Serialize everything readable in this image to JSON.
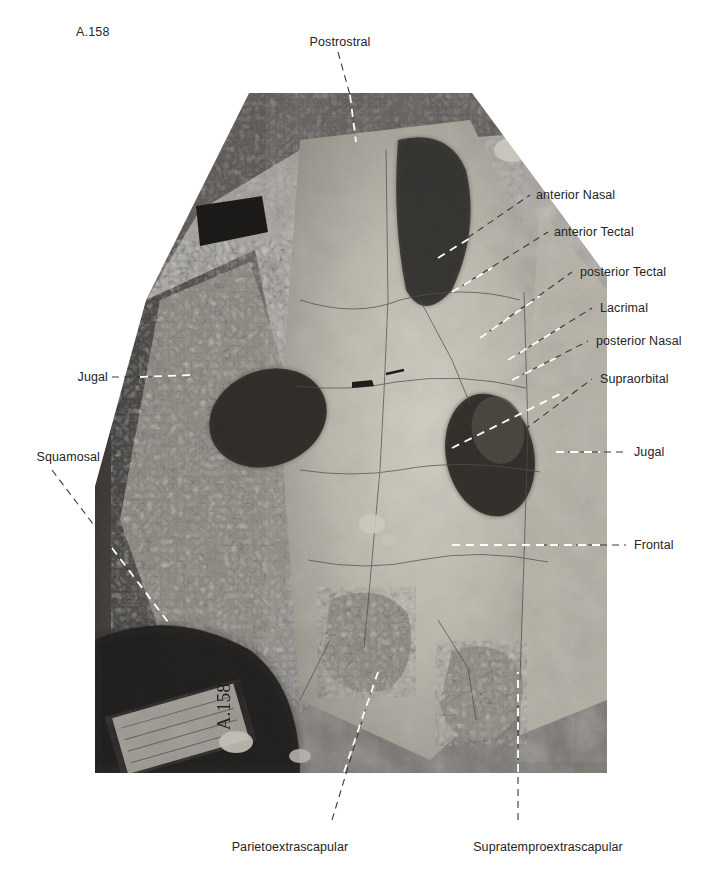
{
  "figure": {
    "specimen_number": "A.158",
    "kind": "fossil-skull-roof-photograph",
    "photo_tone": "black-and-white"
  },
  "labels": {
    "postrostral": "Postrostral",
    "anterior_nasal": "anterior Nasal",
    "anterior_tectal": "anterior Tectal",
    "posterior_tectal": "posterior Tectal",
    "lacrimal": "Lacrimal",
    "posterior_nasal": "posterior Nasal",
    "supraorbital": "Supraorbital",
    "jugal_right": "Jugal",
    "frontal": "Frontal",
    "jugal_left": "Jugal",
    "squamosal": "Squamosal",
    "parietoextrascapular": "Parietoextrascapular",
    "supratemproextrascapular": "Supratemproextrascapular"
  },
  "specimen_card_text": "A.158",
  "colors": {
    "label_text": "#242424",
    "leader_dark": "#3a3a3a",
    "leader_light": "#ffffff",
    "page_background": "#ffffff"
  }
}
